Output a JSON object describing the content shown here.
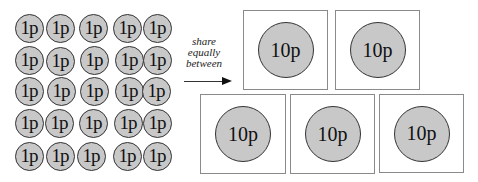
{
  "small_coins": {
    "label": "1p",
    "count": 25,
    "rows": 5,
    "cols": 5
  },
  "action": {
    "lines": [
      "share",
      "equally",
      "between"
    ],
    "arrow_icon": "arrow-right-icon"
  },
  "boxes": [
    {
      "coin": "10p"
    },
    {
      "coin": "10p"
    },
    {
      "coin": "10p"
    },
    {
      "coin": "10p"
    },
    {
      "coin": "10p"
    }
  ],
  "colors": {
    "coin_fill": "#c8c8c8",
    "coin_border": "#333333",
    "box_border": "#8a8a8a"
  }
}
